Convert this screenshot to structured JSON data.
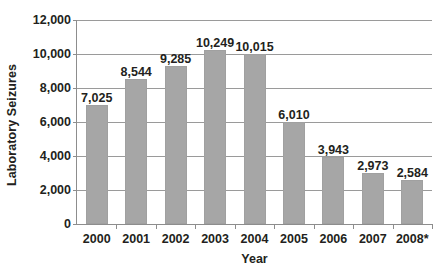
{
  "chart_data": {
    "type": "bar",
    "title": "",
    "subtitle": "",
    "xlabel": "Year",
    "ylabel": "Laboratory Seizures",
    "categories": [
      "2000",
      "2001",
      "2002",
      "2003",
      "2004",
      "2005",
      "2006",
      "2007",
      "2008*"
    ],
    "values": [
      7025,
      8544,
      9285,
      10249,
      10015,
      6010,
      3943,
      2973,
      2584
    ],
    "value_labels": [
      "7,025",
      "8,544",
      "9,285",
      "10,249",
      "10,015",
      "6,010",
      "3,943",
      "2,973",
      "2,584"
    ],
    "ylim": [
      0,
      12000
    ],
    "ytick_values": [
      0,
      2000,
      4000,
      6000,
      8000,
      10000,
      12000
    ],
    "ytick_labels": [
      "0",
      "2,000",
      "4,000",
      "6,000",
      "8,000",
      "10,000",
      "12,000"
    ],
    "grid": true,
    "legend": false,
    "legend_position": "none",
    "bar_color": "#a6a6a6",
    "gridline_color": "#9a9a9a",
    "axis_color": "#8d8d8d",
    "text_color": "#231f20",
    "background_color": "#ffffff"
  }
}
